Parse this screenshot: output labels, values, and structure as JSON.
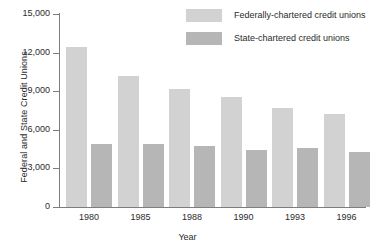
{
  "chart_data": {
    "type": "bar",
    "title": "",
    "xlabel": "Year",
    "ylabel": "Federal and State Credit Unions",
    "categories": [
      "1980",
      "1985",
      "1988",
      "1990",
      "1993",
      "1996"
    ],
    "series": [
      {
        "name": "Federally-chartered credit unions",
        "color": "#d2d2d2",
        "values": [
          12400,
          10150,
          9150,
          8550,
          7700,
          7200
        ]
      },
      {
        "name": "State-chartered credit unions",
        "color": "#b6b6b6",
        "values": [
          4900,
          4900,
          4750,
          4400,
          4600,
          4250
        ]
      }
    ],
    "ylim": [
      0,
      15000
    ],
    "yticks": [
      0,
      3000,
      6000,
      9000,
      12000,
      15000
    ],
    "ytick_labels": [
      "0",
      "3,000",
      "6,000",
      "9,000",
      "12,000",
      "15,000"
    ],
    "grid": false,
    "legend_position": "top-right"
  },
  "axis": {
    "y_title": "Federal and State Credit Unions",
    "x_title": "Year"
  },
  "legend": {
    "items": [
      {
        "label": "Federally-chartered credit unions"
      },
      {
        "label": "State-chartered credit unions"
      }
    ]
  }
}
